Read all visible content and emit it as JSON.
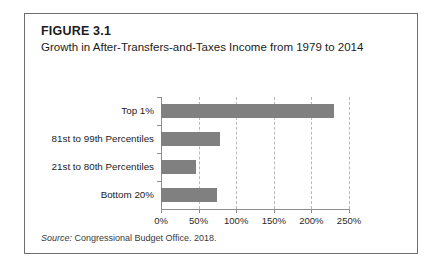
{
  "figure": {
    "number": "FIGURE 3.1",
    "title": "Growth in After-Transfers-and-Taxes Income from 1979 to 2014",
    "source_label": "Source:",
    "source_text": " Congressional Budget Office. 2018."
  },
  "colors": {
    "bar": "#808080",
    "axis": "#8d8d8d",
    "gridline": "#b9b9b9",
    "frame": "#6e6e6e",
    "text": "#1c1c1c"
  },
  "chart_data": {
    "type": "bar",
    "orientation": "horizontal",
    "title": "Growth in After-Transfers-and-Taxes Income from 1979 to 2014",
    "xlabel": "",
    "ylabel": "",
    "categories": [
      "Top 1%",
      "81st to 99th Percentiles",
      "21st to 80th Percentiles",
      "Bottom 20%"
    ],
    "values": [
      230,
      79,
      47,
      74
    ],
    "value_unit": "%",
    "xlim": [
      0,
      250
    ],
    "xticks": [
      0,
      50,
      100,
      150,
      200,
      250
    ],
    "xtick_labels": [
      "0%",
      "50%",
      "100%",
      "150%",
      "200%",
      "250%"
    ],
    "grid": true,
    "grid_axis": "x",
    "legend": false,
    "series": [
      {
        "name": "Income growth 1979-2014",
        "values": [
          230,
          79,
          47,
          74
        ]
      }
    ]
  }
}
